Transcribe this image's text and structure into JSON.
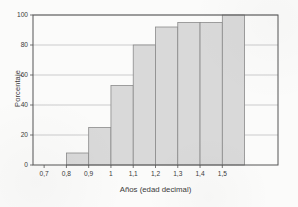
{
  "chart_data": {
    "type": "bar",
    "title": "",
    "subtitle": "",
    "xlabel": "Años (edad decimal)",
    "ylabel": "Porcentaje",
    "categories": [
      "0,8",
      "0,9",
      "1",
      "1,1",
      "1,2",
      "1,3",
      "1,4",
      "1,5"
    ],
    "values": [
      8,
      25,
      53,
      80,
      92,
      95,
      95,
      100
    ],
    "x_tick_labels": [
      "0,7",
      "0,8",
      "0,9",
      "1",
      "1,1",
      "1,2",
      "1,3",
      "1,4",
      "1,5"
    ],
    "x_tick_values": [
      0.7,
      0.8,
      0.9,
      1.0,
      1.1,
      1.2,
      1.3,
      1.4,
      1.5
    ],
    "y_tick_labels": [
      "0",
      "20",
      "40",
      "60",
      "80",
      "100"
    ],
    "y_tick_values": [
      0,
      20,
      40,
      60,
      80,
      100
    ],
    "ylim": [
      0,
      100
    ],
    "xlim": [
      0.65,
      1.75
    ],
    "bin_width": 0.1,
    "bars": [
      {
        "bin_start": 0.7,
        "bin_end": 0.8,
        "value": 0
      },
      {
        "bin_start": 0.8,
        "bin_end": 0.9,
        "value": 8
      },
      {
        "bin_start": 0.9,
        "bin_end": 1.0,
        "value": 25
      },
      {
        "bin_start": 1.0,
        "bin_end": 1.1,
        "value": 53
      },
      {
        "bin_start": 1.1,
        "bin_end": 1.2,
        "value": 80
      },
      {
        "bin_start": 1.2,
        "bin_end": 1.3,
        "value": 92
      },
      {
        "bin_start": 1.3,
        "bin_end": 1.4,
        "value": 95
      },
      {
        "bin_start": 1.4,
        "bin_end": 1.5,
        "value": 95
      },
      {
        "bin_start": 1.5,
        "bin_end": 1.6,
        "value": 100
      }
    ],
    "grid": true,
    "grid_axis": "y",
    "legend": false,
    "legend_position": "none",
    "colors": {
      "bar_fill": "#d9d9d9",
      "bar_edge": "#8a8a8a",
      "grid": "#b8b8b8",
      "axis": "#555555",
      "text": "#3a3a3a",
      "background": "#fbfbfa"
    }
  }
}
